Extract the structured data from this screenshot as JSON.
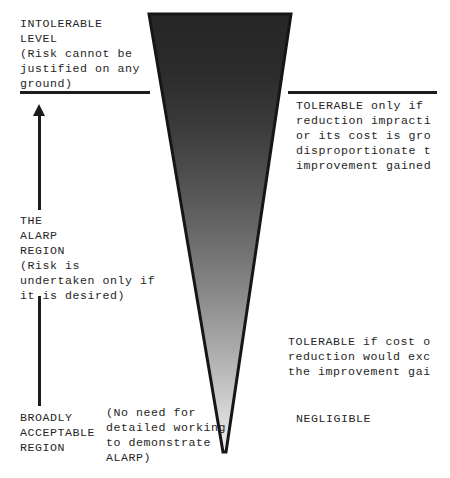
{
  "diagram": {
    "background_color": "#ffffff",
    "ink_color": "#1c1c1c",
    "cone": {
      "name": "risk-cone",
      "gradient_top_color": "#2a2a2a",
      "gradient_bottom_color": "#f2f2f2",
      "outline_color": "#1c1c1c"
    },
    "divider_line": {
      "name": "intolerable-boundary-line"
    },
    "arrow": {
      "name": "alarp-region-arrow",
      "direction": "up"
    },
    "labels": {
      "intolerable": "INTOLERABLE\nLEVEL\n(Risk cannot be\njustified on any\nground)",
      "alarp_region": "THE\nALARP\nREGION\n(Risk is\nundertaken only if\nit is desired)",
      "broadly_acceptable": "BROADLY\nACCEPTABLE\nREGION",
      "no_need_note": "(No need for\ndetailed working\nto demonstrate\nALARP)",
      "tolerable_upper": "TOLERABLE only if\nreduction impracti\nor its cost is gro\ndisproportionate t\nimprovement gained",
      "tolerable_lower": "TOLERABLE if cost o\nreduction would exc\nthe improvement gai",
      "negligible": "NEGLIGIBLE"
    }
  }
}
